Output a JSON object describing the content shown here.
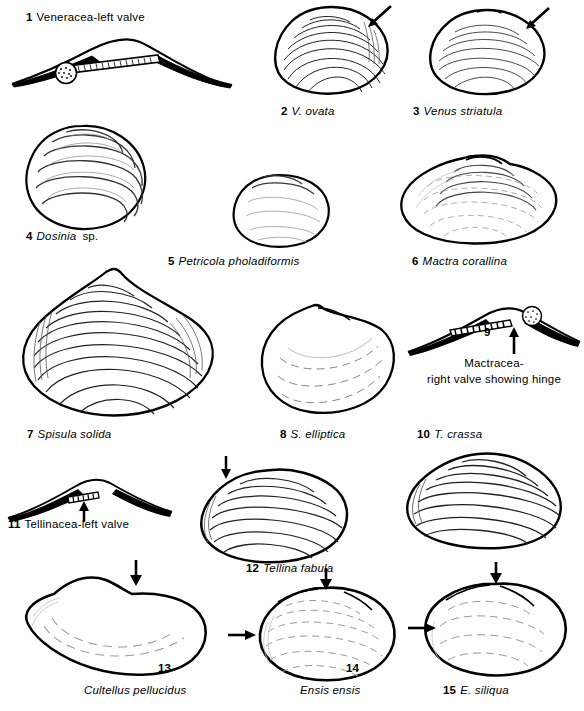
{
  "plate": {
    "title": "Bivalve shell identification plate",
    "ink_color": "#000000",
    "background_color": "#ffffff",
    "line_color": "#1a1a1a",
    "faint_line_color": "#9a9a9a"
  },
  "figures": [
    {
      "number": "1",
      "name_plain": "Veneracea-left valve",
      "name_sci": "",
      "kind": "hinge-diagram",
      "arrow": "none"
    },
    {
      "number": "2",
      "name_plain": "",
      "name_sci": "V. ovata",
      "kind": "shell",
      "arrow": "upper-right"
    },
    {
      "number": "3",
      "name_plain": "",
      "name_sci": "Venus striatula",
      "kind": "shell",
      "arrow": "upper-right"
    },
    {
      "number": "4",
      "name_plain": "sp.",
      "name_sci": "Dosinia",
      "kind": "shell",
      "arrow": "none"
    },
    {
      "number": "5",
      "name_plain": "",
      "name_sci": "Petricola pholadiformis",
      "kind": "shell",
      "arrow": "none"
    },
    {
      "number": "6",
      "name_plain": "",
      "name_sci": "Mactra corallina",
      "kind": "shell",
      "arrow": "none"
    },
    {
      "number": "7",
      "name_plain": "",
      "name_sci": "Spisula solida",
      "kind": "shell",
      "arrow": "none"
    },
    {
      "number": "8",
      "name_plain": "",
      "name_sci": "S. elliptica",
      "kind": "shell",
      "arrow": "none"
    },
    {
      "number": "9",
      "name_plain": "Mactracea-\nright valve showing hinge",
      "name_sci": "",
      "kind": "hinge-diagram",
      "arrow": "up"
    },
    {
      "number": "10",
      "name_plain": "",
      "name_sci": "T. crassa",
      "kind": "shell",
      "arrow": "none"
    },
    {
      "number": "11",
      "name_plain": "Tellinacea-left valve",
      "name_sci": "",
      "kind": "hinge-diagram",
      "arrow": "up"
    },
    {
      "number": "12",
      "name_plain": "",
      "name_sci": "Tellina fabula",
      "kind": "shell",
      "arrow": "upper-left"
    },
    {
      "number": "13",
      "name_plain": "",
      "name_sci": "Cultellus pellucidus",
      "kind": "shell",
      "arrow": "top"
    },
    {
      "number": "14",
      "name_plain": "",
      "name_sci": "Ensis ensis",
      "kind": "shell",
      "arrow": "top-and-left"
    },
    {
      "number": "15",
      "name_plain": "",
      "name_sci": "E. siliqua",
      "kind": "shell",
      "arrow": "top-and-left"
    }
  ],
  "captions": {
    "c1": {
      "num": "1",
      "text": "Veneracea-left valve",
      "italic": false
    },
    "c2": {
      "num": "2",
      "text": "V. ovata",
      "italic": true
    },
    "c3": {
      "num": "3",
      "text": "Venus striatula",
      "italic": true
    },
    "c4_num": "4",
    "c4_sci": "Dosinia",
    "c4_plain": "sp.",
    "c5": {
      "num": "5",
      "text": "Petricola pholadiformis",
      "italic": true
    },
    "c6": {
      "num": "6",
      "text": "Mactra corallina",
      "italic": true
    },
    "c7": {
      "num": "7",
      "text": "Spisula solida",
      "italic": true
    },
    "c8": {
      "num": "8",
      "text": "S. elliptica",
      "italic": true
    },
    "c9_num": "9",
    "c9_line1": "Mactracea-",
    "c9_line2": "right valve showing hinge",
    "c10": {
      "num": "10",
      "text": "T. crassa",
      "italic": true
    },
    "c11": {
      "num": "11",
      "text": "Tellinacea-left valve",
      "italic": false
    },
    "c12": {
      "num": "12",
      "text": "Tellina fabula",
      "italic": true
    },
    "c13_num": "13",
    "c13_sci": "Cultellus pellucidus",
    "c14_num": "14",
    "c14_sci": "Ensis ensis",
    "c15": {
      "num": "15",
      "text": "E. siliqua",
      "italic": true
    }
  }
}
